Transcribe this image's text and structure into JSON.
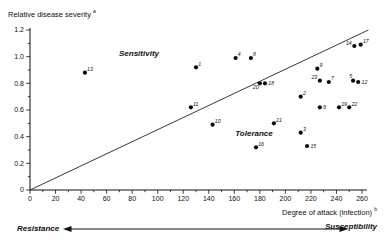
{
  "chart_data": {
    "type": "scatter",
    "title": "",
    "ylabel": "Relative disease severity",
    "ylabel_superscript": "a",
    "xlabel": "Degree of attack (infection)",
    "xlabel_superscript": "b",
    "xlim": [
      0,
      260
    ],
    "ylim": [
      0,
      1.2
    ],
    "x_minor_step": 10,
    "y_minor_step": 0.1,
    "x_tick_labels": [
      "0",
      "20",
      "40",
      "60",
      "80",
      "100",
      "120",
      "140",
      "160",
      "180",
      "200",
      "220",
      "240",
      "260"
    ],
    "y_tick_labels": [
      "0",
      "0.2",
      "0.4",
      "0.6",
      "0.8",
      "1.0",
      "1.2"
    ],
    "grid": false,
    "legend": "none",
    "diagonal_line": {
      "from": [
        0,
        0
      ],
      "to": [
        265,
        1.2
      ]
    },
    "region_labels": [
      {
        "text": "Sensitivity",
        "x": 85,
        "y": 1.01
      },
      {
        "text": "Tolerance",
        "x": 176,
        "y": 0.41
      }
    ],
    "points": [
      {
        "id": 1,
        "x": 130,
        "y": 0.92,
        "label_pos": "tr"
      },
      {
        "id": 2,
        "x": 212,
        "y": 0.7,
        "label_pos": "tr"
      },
      {
        "id": 3,
        "x": 212,
        "y": 0.43,
        "label_pos": "tr"
      },
      {
        "id": 4,
        "x": 161,
        "y": 0.99,
        "label_pos": "tr"
      },
      {
        "id": 5,
        "x": 253,
        "y": 0.82,
        "label_pos": "tl"
      },
      {
        "id": 6,
        "x": 227,
        "y": 0.62,
        "label_pos": "r"
      },
      {
        "id": 7,
        "x": 234,
        "y": 0.81,
        "label_pos": "tr"
      },
      {
        "id": 8,
        "x": 173,
        "y": 0.99,
        "label_pos": "tr"
      },
      {
        "id": 9,
        "x": 225,
        "y": 0.91,
        "label_pos": "tr"
      },
      {
        "id": 10,
        "x": 143,
        "y": 0.49,
        "label_pos": "tr"
      },
      {
        "id": 11,
        "x": 126,
        "y": 0.62,
        "label_pos": "tr"
      },
      {
        "id": 12,
        "x": 257,
        "y": 0.81,
        "label_pos": "r"
      },
      {
        "id": 13,
        "x": 43,
        "y": 0.88,
        "label_pos": "tr"
      },
      {
        "id": 14,
        "x": 254,
        "y": 1.08,
        "label_pos": "l"
      },
      {
        "id": 15,
        "x": 217,
        "y": 0.33,
        "label_pos": "r"
      },
      {
        "id": 16,
        "x": 177,
        "y": 0.32,
        "label_pos": "tr"
      },
      {
        "id": 17,
        "x": 259,
        "y": 1.09,
        "label_pos": "tr"
      },
      {
        "id": 18,
        "x": 184,
        "y": 0.8,
        "label_pos": "r"
      },
      {
        "id": 19,
        "x": 242,
        "y": 0.62,
        "label_pos": "tr"
      },
      {
        "id": 20,
        "x": 180,
        "y": 0.8,
        "label_pos": "bl"
      },
      {
        "id": 21,
        "x": 191,
        "y": 0.5,
        "label_pos": "tr"
      },
      {
        "id": 22,
        "x": 250,
        "y": 0.62,
        "label_pos": "tr"
      },
      {
        "id": 23,
        "x": 227,
        "y": 0.82,
        "label_pos": "l"
      }
    ],
    "footer": {
      "left": "Resistance",
      "right": "Susceptibility"
    }
  }
}
